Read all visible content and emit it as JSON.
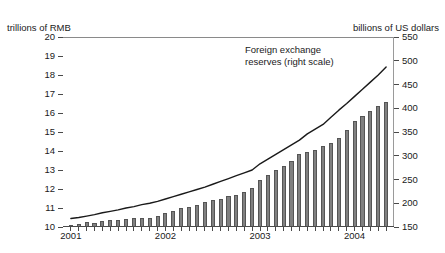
{
  "axis_captions": {
    "left": "trillions of RMB",
    "right": "billions of US dollars"
  },
  "annotation": {
    "line1": "Foreign exchange",
    "line2": "reserves (right scale)"
  },
  "colors": {
    "bar_fill": "#808080",
    "bar_edge": "#555555",
    "line": "#1a1a1a",
    "axis": "#4a4a4a",
    "background": "#ffffff"
  },
  "chart_data": {
    "type": "bar",
    "title": "",
    "xlabel": "",
    "grid": false,
    "legend_position": "inline-annotation",
    "x_tick_labels": [
      "2001",
      "2002",
      "2003",
      "2004"
    ],
    "x_tick_label_positions": [
      0,
      12,
      24,
      36
    ],
    "x_minor_ticks": 41,
    "axes": {
      "left": {
        "label": "trillions of RMB",
        "ylim": [
          10,
          20
        ],
        "ticks": [
          10,
          11,
          12,
          13,
          14,
          15,
          16,
          17,
          18,
          19,
          20
        ],
        "tick_labels": [
          "10",
          "11",
          "12",
          "13",
          "14",
          "15",
          "16",
          "17",
          "18",
          "19",
          "20"
        ]
      },
      "right": {
        "label": "billions of US dollars",
        "ylim": [
          150,
          550
        ],
        "ticks": [
          150,
          200,
          250,
          300,
          350,
          400,
          450,
          500,
          550
        ],
        "tick_labels": [
          "150",
          "200",
          "250",
          "300",
          "350",
          "400",
          "450",
          "500",
          "550"
        ]
      }
    },
    "series": [
      {
        "name": "Money supply (left scale)",
        "type": "bar",
        "axis": "left",
        "unit": "trillions of RMB",
        "categories": [
          "2001-01",
          "2001-02",
          "2001-03",
          "2001-04",
          "2001-05",
          "2001-06",
          "2001-07",
          "2001-08",
          "2001-09",
          "2001-10",
          "2001-11",
          "2001-12",
          "2002-01",
          "2002-02",
          "2002-03",
          "2002-04",
          "2002-05",
          "2002-06",
          "2002-07",
          "2002-08",
          "2002-09",
          "2002-10",
          "2002-11",
          "2002-12",
          "2003-01",
          "2003-02",
          "2003-03",
          "2003-04",
          "2003-05",
          "2003-06",
          "2003-07",
          "2003-08",
          "2003-09",
          "2003-10",
          "2003-11",
          "2003-12",
          "2004-01",
          "2004-02",
          "2004-03",
          "2004-04",
          "2004-05"
        ],
        "values": [
          10.1,
          10.15,
          10.25,
          10.22,
          10.3,
          10.35,
          10.35,
          10.4,
          10.45,
          10.45,
          10.5,
          10.6,
          10.75,
          10.85,
          11.0,
          11.05,
          11.15,
          11.3,
          11.4,
          11.5,
          11.65,
          11.7,
          11.85,
          12.05,
          12.45,
          12.75,
          13.0,
          13.2,
          13.45,
          13.85,
          13.95,
          14.05,
          14.25,
          14.4,
          14.7,
          15.1,
          15.6,
          15.85,
          16.1,
          16.35,
          16.6
        ]
      },
      {
        "name": "Foreign exchange reserves (right scale)",
        "type": "line",
        "axis": "right",
        "unit": "billions of US dollars",
        "categories": [
          "2001-01",
          "2001-02",
          "2001-03",
          "2001-04",
          "2001-05",
          "2001-06",
          "2001-07",
          "2001-08",
          "2001-09",
          "2001-10",
          "2001-11",
          "2001-12",
          "2002-01",
          "2002-02",
          "2002-03",
          "2002-04",
          "2002-05",
          "2002-06",
          "2002-07",
          "2002-08",
          "2002-09",
          "2002-10",
          "2002-11",
          "2002-12",
          "2003-01",
          "2003-02",
          "2003-03",
          "2003-04",
          "2003-05",
          "2003-06",
          "2003-07",
          "2003-08",
          "2003-09",
          "2003-10",
          "2003-11",
          "2003-12",
          "2004-01",
          "2004-02",
          "2004-03",
          "2004-04",
          "2004-05"
        ],
        "values": [
          168,
          170,
          173,
          176,
          180,
          183,
          186,
          190,
          193,
          197,
          200,
          204,
          209,
          214,
          219,
          224,
          229,
          234,
          240,
          246,
          252,
          258,
          264,
          270,
          283,
          293,
          303,
          313,
          323,
          333,
          346,
          356,
          366,
          381,
          396,
          410,
          425,
          440,
          455,
          470,
          487
        ]
      }
    ]
  }
}
